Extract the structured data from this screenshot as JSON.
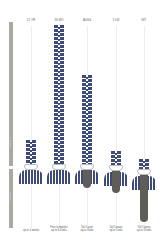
{
  "sidebar": {
    "color": "#a9a9a4",
    "upper_label": "length of tie",
    "lower_label": "tail length"
  },
  "colors": {
    "chain_blue": "#3d4a7a",
    "tail_gray": "#5e5d58",
    "background": "#ffffff"
  },
  "columns": [
    {
      "header": "21 YR",
      "footer_line1": "up to 4 weeks",
      "footer_line2": "",
      "chain_top": 140,
      "tail_bottom": 0
    },
    {
      "header": "36 MO",
      "footer_line1": "Four to months",
      "footer_line2": "up to 6-8 wks",
      "chain_top": 25,
      "tail_bottom": 0
    },
    {
      "header": "AUG4",
      "footer_line1": "Tail 1 year",
      "footer_line2": "up to 3 wks",
      "chain_top": 75,
      "tail_bottom": 188
    },
    {
      "header": "1 LW",
      "footer_line1": "Tail 5 years",
      "footer_line2": "up to 5 wks",
      "chain_top": 151,
      "tail_bottom": 193
    },
    {
      "header": "NIT",
      "footer_line1": "Tail 5 years",
      "footer_line2": "up to 10 wks",
      "chain_top": 160,
      "tail_bottom": 222
    }
  ]
}
